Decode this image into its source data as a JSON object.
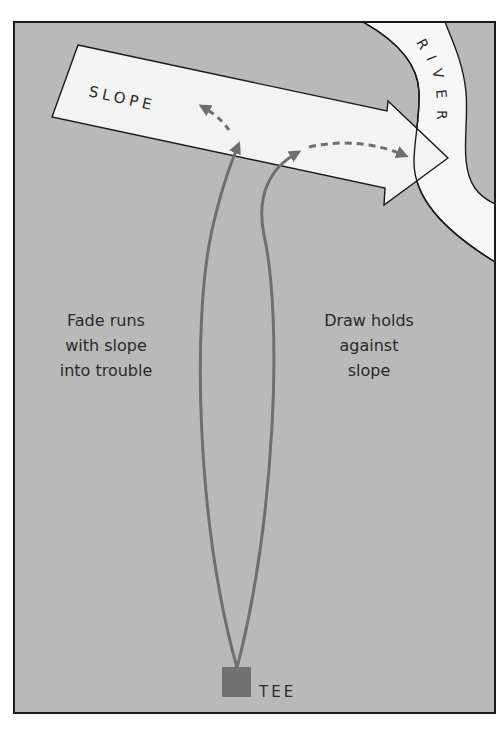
{
  "diagram": {
    "title": "",
    "colors": {
      "background": "#ffffff",
      "ground": "#b9b9b9",
      "slope_arrow_fill": "#f3f3f3",
      "river_fill": "#f7f7f7",
      "outline": "#1a1a1a",
      "flight_path": "#6f6f6f",
      "tee": "#707070",
      "text": "#2a2a2a"
    },
    "labels": {
      "slope": "SLOPE",
      "river": "RIVER",
      "tee": "TEE"
    },
    "annotations": {
      "fade": {
        "lines": [
          "Fade runs",
          "with slope",
          "into trouble"
        ]
      },
      "draw": {
        "lines": [
          "Draw holds",
          "against",
          "slope"
        ]
      }
    },
    "shots": [
      {
        "name": "fade",
        "direction": "left-curving, carried by slope toward river"
      },
      {
        "name": "draw",
        "direction": "right-curving, holds against slope"
      }
    ]
  }
}
